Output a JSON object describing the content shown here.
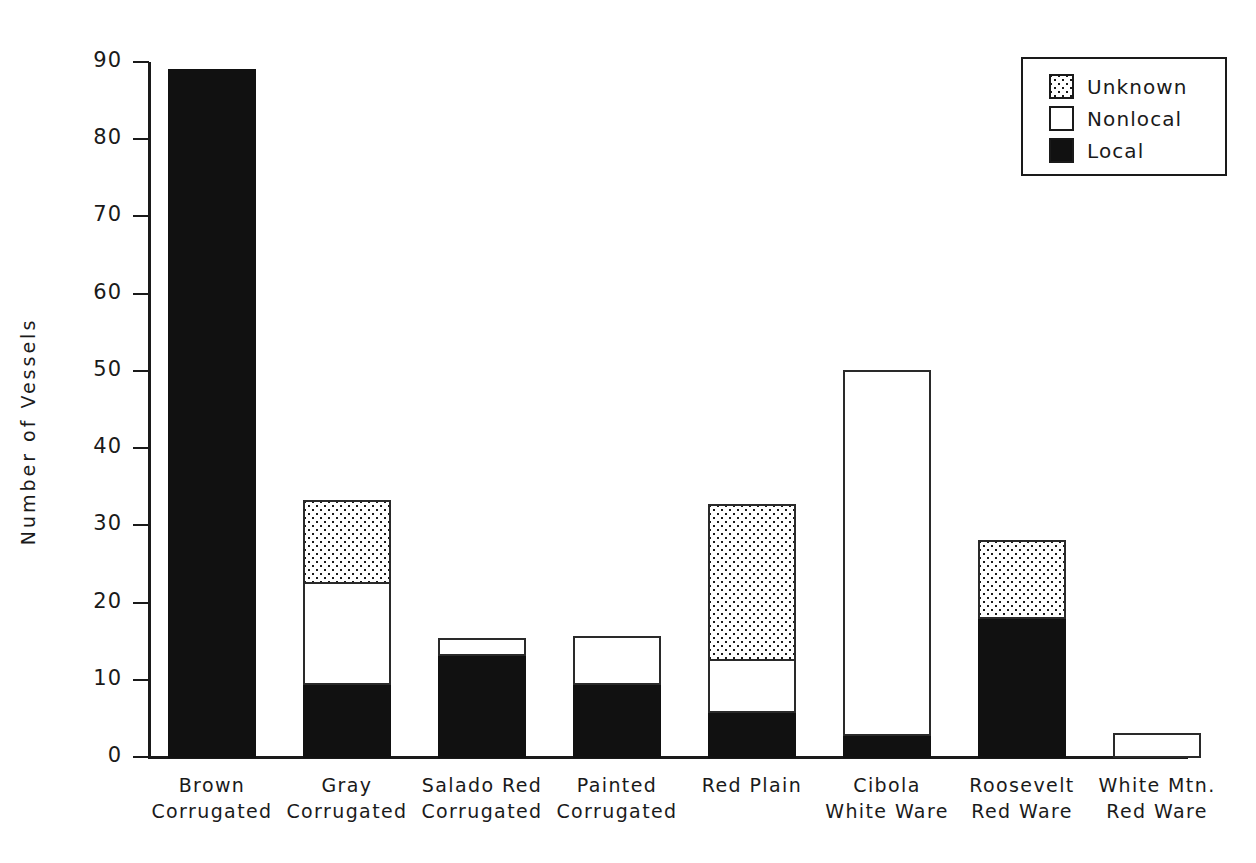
{
  "chart_data": {
    "type": "bar",
    "stacked": true,
    "title": "",
    "subtitle": "",
    "xlabel": "",
    "ylabel": "Number of Vessels",
    "ylim": [
      0,
      90
    ],
    "ytick_labels": [
      "0",
      "10",
      "20",
      "30",
      "40",
      "50",
      "60",
      "70",
      "80",
      "90"
    ],
    "ytick_values": [
      0,
      10,
      20,
      30,
      40,
      50,
      60,
      70,
      80,
      90
    ],
    "grid": false,
    "legend_position": "top-right",
    "categories": [
      "Brown Corrugated",
      "Gray Corrugated",
      "Salado Red Corrugated",
      "Painted Corrugated",
      "Red Plain",
      "Cibola White Ware",
      "Roosevelt Red Ware",
      "White Mtn. Red Ware"
    ],
    "category_lines": [
      [
        "Brown",
        "Corrugated"
      ],
      [
        "Gray",
        "Corrugated"
      ],
      [
        "Salado Red",
        "Corrugated"
      ],
      [
        "Painted",
        "Corrugated"
      ],
      [
        "Red Plain",
        ""
      ],
      [
        "Cibola",
        "White Ware"
      ],
      [
        "Roosevelt",
        "Red Ware"
      ],
      [
        "White Mtn.",
        "Red Ware"
      ]
    ],
    "series": [
      {
        "name": "Local",
        "fill": "solid-black",
        "color": "#111111",
        "values": [
          89,
          9.5,
          13.2,
          9.5,
          5.8,
          2.8,
          18,
          0
        ]
      },
      {
        "name": "Nonlocal",
        "fill": "white",
        "color": "#ffffff",
        "values": [
          0,
          13,
          2.1,
          6,
          6.8,
          47.2,
          0,
          3
        ]
      },
      {
        "name": "Unknown",
        "fill": "stippled",
        "color": "#ffffff",
        "values": [
          0,
          10.7,
          0,
          0,
          20,
          0,
          10,
          0
        ]
      }
    ],
    "totals": [
      89,
      33.2,
      15.3,
      15.5,
      32.6,
      50,
      28,
      3
    ]
  },
  "legend": {
    "entries": [
      {
        "label": "Unknown",
        "swatch": "stippled-swatch"
      },
      {
        "label": "Nonlocal",
        "swatch": "white-swatch"
      },
      {
        "label": "Local",
        "swatch": "black-swatch"
      }
    ]
  }
}
